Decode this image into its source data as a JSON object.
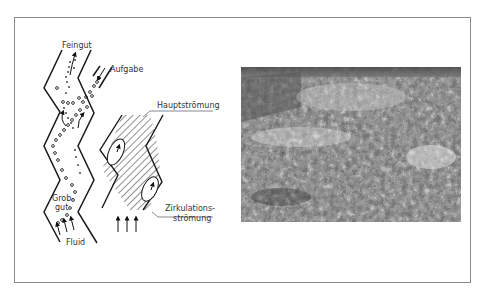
{
  "figure": {
    "left_diagram": {
      "labels": {
        "fine": "Feingut",
        "feed": "Aufgabe",
        "coarse_line1": "Grob-",
        "coarse_line2": "gut",
        "fluid": "Fluid"
      }
    },
    "middle_diagram": {
      "labels": {
        "main_flow": "Hauptströmung",
        "circulation_line1": "Zirkulations-",
        "circulation_line2": "strömung"
      }
    },
    "photo": {
      "subject": "heap of shredded waste material (black-and-white photograph)"
    }
  },
  "colors": {
    "line": "#1a1a1a",
    "label": "#333333",
    "frame": "#8a8a8a"
  }
}
